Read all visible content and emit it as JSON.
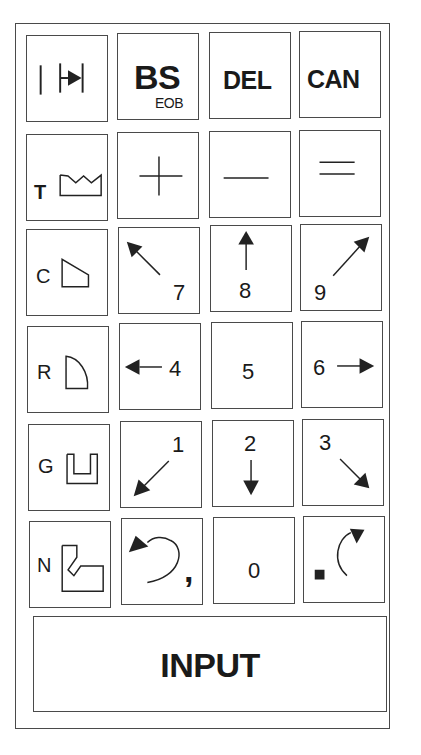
{
  "keypad": {
    "row1": {
      "eob_insert": {
        "icon": "insert-block-icon"
      },
      "bs": {
        "label": "BS",
        "sublabel": "EOB"
      },
      "del": {
        "label": "DEL"
      },
      "can": {
        "label": "CAN"
      }
    },
    "row2": {
      "tool": {
        "letter": "T",
        "icon": "crown-tool-icon"
      },
      "plus": {
        "icon": "plus-icon"
      },
      "minus": {
        "icon": "minus-icon"
      },
      "equals": {
        "icon": "equals-icon"
      }
    },
    "row3": {
      "chamfer": {
        "letter": "C",
        "icon": "chamfer-shape-icon"
      },
      "seven": {
        "label": "7",
        "icon": "arrow-up-left-icon"
      },
      "eight": {
        "label": "8",
        "icon": "arrow-up-icon"
      },
      "nine": {
        "label": "9",
        "icon": "arrow-up-right-icon"
      }
    },
    "row4": {
      "radius": {
        "letter": "R",
        "icon": "radius-shape-icon"
      },
      "four": {
        "label": "4",
        "icon": "arrow-left-icon"
      },
      "five": {
        "label": "5"
      },
      "six": {
        "label": "6",
        "icon": "arrow-right-icon"
      }
    },
    "row5": {
      "groove": {
        "letter": "G",
        "icon": "groove-shape-icon"
      },
      "one": {
        "label": "1",
        "icon": "arrow-down-left-icon"
      },
      "two": {
        "label": "2",
        "icon": "arrow-down-icon"
      },
      "three": {
        "label": "3",
        "icon": "arrow-down-right-icon"
      }
    },
    "row6": {
      "notch": {
        "letter": "N",
        "icon": "notch-shape-icon"
      },
      "comma": {
        "label": ",",
        "icon": "arc-ccw-arrow-icon"
      },
      "zero": {
        "label": "0"
      },
      "point": {
        "label": ".",
        "icon": "arc-cw-arrow-icon"
      }
    },
    "input": {
      "label": "INPUT"
    }
  }
}
